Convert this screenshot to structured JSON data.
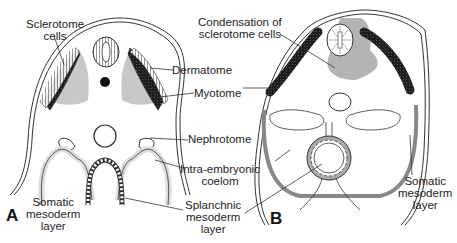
{
  "figure": {
    "panels": [
      {
        "id": "A",
        "label": "A"
      },
      {
        "id": "B",
        "label": "B"
      }
    ],
    "labels": {
      "sclerotome_cells": [
        "Sclerotome",
        "cells"
      ],
      "dermatome": "Dermatome",
      "myotome": "Myotome",
      "nephrotome": "Nephrotome",
      "intra_embryonic_coelom": [
        "Intra-embryonic",
        "coelom"
      ],
      "splanchnic_mesoderm_layer": [
        "Splanchnic",
        "mesoderm",
        "layer"
      ],
      "somatic_mesoderm_layer_a": [
        "Somatic",
        "mesoderm",
        "layer"
      ],
      "condensation_sclerotome": [
        "Condensation of",
        "sclerotome cells"
      ],
      "somatic_mesoderm_layer_b": [
        "Somatic",
        "mesoderm",
        "layer"
      ]
    },
    "colors": {
      "outline": "#333333",
      "shade": "#c8c8c8",
      "dark": "#1e1e1e",
      "background": "#ffffff"
    }
  }
}
